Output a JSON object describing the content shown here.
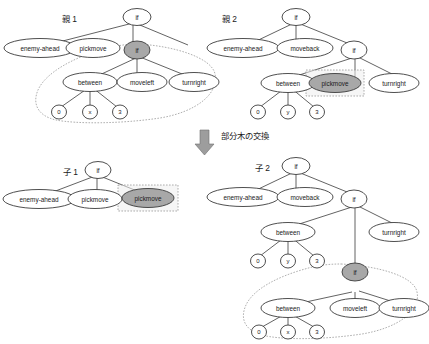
{
  "figure": {
    "title_caption": "部分木の交換",
    "arrow_icon": "down-arrow-icon"
  },
  "labels": {
    "parent1": "親 1",
    "parent2": "親 2",
    "child1": "子 1",
    "child2": "子 2"
  },
  "colors": {
    "node_fill": "#ffffff",
    "node_stroke": "#3b3b3b",
    "highlight_fill": "#a8a8a8",
    "selection_stroke": "#9a9a9a",
    "arrow_fill": "#9d9d9d",
    "text": "#1a1a1a",
    "background": "#ffffff"
  },
  "trees": {
    "parent1": {
      "caption": "親 1",
      "root": "if",
      "nodes": {
        "root": "if",
        "c1": "enemy-ahead",
        "c2": "pickmove",
        "c3": "if",
        "g1": "between",
        "g2": "moveleft",
        "g3": "turnright",
        "l1": "0",
        "l2": "x",
        "l3": "3"
      },
      "highlighted_node": "if",
      "selected_subtree_root": "if",
      "selection_style": "dotted-lasso"
    },
    "parent2": {
      "caption": "親 2",
      "root": "if",
      "nodes": {
        "root": "if",
        "c1": "enemy-ahead",
        "c2": "moveback",
        "c3": "if",
        "g1": "between",
        "g2": "pickmove",
        "g3": "turnright",
        "l1": "0",
        "l2": "y",
        "l3": "3"
      },
      "highlighted_node": "pickmove",
      "selected_subtree_root": "pickmove",
      "selection_style": "dotted-rect"
    },
    "child1": {
      "caption": "子 1",
      "root": "if",
      "nodes": {
        "root": "if",
        "c1": "enemy-ahead",
        "c2": "pickmove",
        "c3": "pickmove"
      },
      "highlighted_node": "pickmove",
      "selected_subtree_root": "pickmove",
      "selection_style": "dotted-rect"
    },
    "child2": {
      "caption": "子 2",
      "root": "if",
      "nodes": {
        "root": "if",
        "c1": "enemy-ahead",
        "c2": "moveback",
        "c3": "if",
        "g1": "between",
        "g2": "turnright",
        "l1": "0",
        "l2": "y",
        "l3": "3",
        "sub_root": "if",
        "s1": "between",
        "s2": "moveleft",
        "s3": "turnright",
        "sl1": "0",
        "sl2": "x",
        "sl3": "3"
      },
      "highlighted_node": "if",
      "selected_subtree_root": "if",
      "selection_style": "dotted-lasso"
    }
  }
}
